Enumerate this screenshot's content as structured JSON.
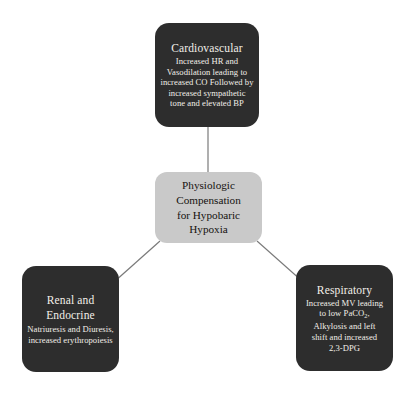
{
  "diagram": {
    "type": "concept-map",
    "background_color": "#ffffff",
    "node_dark_color": "#2d2d2d",
    "node_center_color": "#c9c9c9",
    "connector_color": "#7a7a7a",
    "center": {
      "line1": "Physiologic",
      "line2": "Compensation",
      "line3": "for Hypobaric",
      "line4": "Hypoxia"
    },
    "nodes": [
      {
        "id": "cardiovascular",
        "title": "Cardiovascular",
        "body": "Increased HR and Vasodilation leading to increased CO Followed by increased sympathetic tone and elevated BP"
      },
      {
        "id": "renal-endocrine",
        "title_line1": "Renal and",
        "title_line2": "Endocrine",
        "body": "Natriuresis and Diuresis, increased erythropoiesis"
      },
      {
        "id": "respiratory",
        "title": "Respiratory",
        "body_line1": "Increased MV leading",
        "body_line2_pre": "to low PaCO",
        "body_line2_sub": "2",
        "body_line2_post": ",",
        "body_line3": "Alkylosis and left",
        "body_line4": "shift and increased",
        "body_line5": "2,3-DPG"
      }
    ],
    "connections": [
      {
        "from": "center",
        "to": "cardiovascular"
      },
      {
        "from": "center",
        "to": "renal-endocrine"
      },
      {
        "from": "center",
        "to": "respiratory"
      }
    ]
  }
}
